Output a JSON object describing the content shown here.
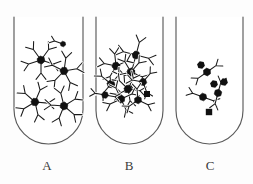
{
  "figure": {
    "kind": "immunology-precipitin-diagram",
    "background_color": "#fdfdfd",
    "width": 253,
    "height": 184,
    "ink_color": "#1a1a1a",
    "glass_color": "#5a5a5a",
    "antigen_fill": "#111111",
    "antibody_fill": "#ffffff"
  },
  "tubes": [
    {
      "id": "A",
      "label": "A",
      "label_x": 47,
      "label_y": 167,
      "left": 14,
      "right": 83,
      "top": 17,
      "bottom": 144,
      "description": "moderate-size antibody-antigen lattice clusters",
      "complex_count": 5,
      "free_antigen_count": 0,
      "complexes": [
        {
          "cx": 41,
          "cy": 60,
          "r": 2.9,
          "arms": 5,
          "rot": 18,
          "arm_len": 13
        },
        {
          "cx": 64,
          "cy": 71,
          "r": 2.9,
          "arms": 5,
          "rot": 62,
          "arm_len": 13
        },
        {
          "cx": 35,
          "cy": 102,
          "r": 2.9,
          "arms": 5,
          "rot": 5,
          "arm_len": 13
        },
        {
          "cx": 64,
          "cy": 106,
          "r": 2.9,
          "arms": 5,
          "rot": 40,
          "arm_len": 13
        },
        {
          "cx": 63,
          "cy": 44,
          "r": 1.6,
          "arms": 1,
          "rot": 200,
          "arm_len": 9
        }
      ],
      "free_antigens": []
    },
    {
      "id": "B",
      "label": "B",
      "label_x": 129,
      "label_y": 167,
      "left": 96,
      "right": 163,
      "top": 17,
      "bottom": 144,
      "description": "large interconnected lattice network at equivalence",
      "complex_count": 9,
      "free_antigen_count": 1,
      "complexes": [
        {
          "cx": 136,
          "cy": 55,
          "r": 2.9,
          "arms": 4,
          "rot": 15,
          "arm_len": 13
        },
        {
          "cx": 116,
          "cy": 66,
          "r": 2.9,
          "arms": 5,
          "rot": 48,
          "arm_len": 12
        },
        {
          "cx": 131,
          "cy": 72,
          "r": 2.9,
          "arms": 5,
          "rot": 95,
          "arm_len": 12
        },
        {
          "cx": 111,
          "cy": 84,
          "r": 2.9,
          "arms": 4,
          "rot": 130,
          "arm_len": 12
        },
        {
          "cx": 128,
          "cy": 89,
          "r": 2.9,
          "arms": 5,
          "rot": 8,
          "arm_len": 12
        },
        {
          "cx": 143,
          "cy": 82,
          "r": 2.6,
          "arms": 3,
          "rot": 70,
          "arm_len": 11
        },
        {
          "cx": 121,
          "cy": 99,
          "r": 2.9,
          "arms": 4,
          "rot": 155,
          "arm_len": 12
        },
        {
          "cx": 138,
          "cy": 100,
          "r": 2.6,
          "arms": 3,
          "rot": 25,
          "arm_len": 11
        },
        {
          "cx": 105,
          "cy": 95,
          "r": 2.3,
          "arms": 2,
          "rot": 190,
          "arm_len": 10
        }
      ],
      "free_antigens": [
        {
          "cx": 147,
          "cy": 94,
          "r": 3.0,
          "shape": "square"
        }
      ]
    },
    {
      "id": "C",
      "label": "C",
      "label_x": 210,
      "label_y": 167,
      "left": 176,
      "right": 243,
      "top": 17,
      "bottom": 144,
      "description": "small dispersed complexes with excess free antigen",
      "complex_count": 3,
      "free_antigen_count": 4,
      "complexes": [
        {
          "cx": 207,
          "cy": 72,
          "r": 2.7,
          "arms": 2,
          "rot": 145,
          "arm_len": 11
        },
        {
          "cx": 203,
          "cy": 97,
          "r": 2.7,
          "arms": 2,
          "rot": 200,
          "arm_len": 11
        },
        {
          "cx": 218,
          "cy": 93,
          "r": 2.7,
          "arms": 2,
          "rot": 285,
          "arm_len": 11
        }
      ],
      "free_antigens": [
        {
          "cx": 201,
          "cy": 65,
          "r": 3.0,
          "shape": "hex"
        },
        {
          "cx": 214,
          "cy": 84,
          "r": 3.0,
          "shape": "hex"
        },
        {
          "cx": 224,
          "cy": 82,
          "r": 3.0,
          "shape": "hex"
        },
        {
          "cx": 209,
          "cy": 112,
          "r": 3.2,
          "shape": "square"
        }
      ]
    }
  ]
}
